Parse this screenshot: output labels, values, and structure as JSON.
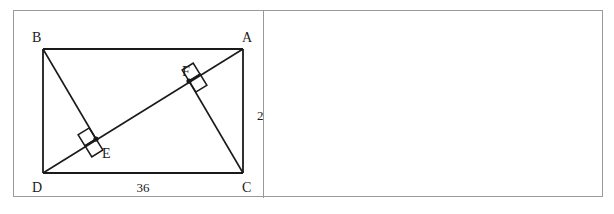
{
  "figure": {
    "shape": "rectangle",
    "vertices": [
      {
        "name": "B",
        "label": "B",
        "x": 29,
        "y": 38,
        "label_x": 18,
        "label_y": 31
      },
      {
        "name": "A",
        "label": "A",
        "x": 229,
        "y": 38,
        "label_x": 228,
        "label_y": 31
      },
      {
        "name": "C",
        "label": "C",
        "x": 229,
        "y": 162,
        "label_x": 228,
        "label_y": 181
      },
      {
        "name": "D",
        "label": "D",
        "x": 29,
        "y": 162,
        "label_x": 18,
        "label_y": 181
      }
    ],
    "points": [
      {
        "name": "E",
        "label": "E",
        "x": 82,
        "y": 128,
        "label_x": 88,
        "label_y": 147
      },
      {
        "name": "F",
        "label": "F",
        "x": 175,
        "y": 70,
        "label_x": 168,
        "label_y": 65
      }
    ],
    "segments": [
      {
        "name": "side-BA",
        "from": "B",
        "to": "A"
      },
      {
        "name": "side-AC",
        "from": "A",
        "to": "C"
      },
      {
        "name": "side-CD",
        "from": "C",
        "to": "D"
      },
      {
        "name": "side-DB",
        "from": "D",
        "to": "B"
      },
      {
        "name": "diagonal-DA",
        "from": "D",
        "to": "A"
      },
      {
        "name": "perpendicular-BE",
        "from": "B",
        "to": "E"
      },
      {
        "name": "perpendicular-CF",
        "from": "C",
        "to": "F"
      }
    ],
    "right_angles": [
      {
        "name": "right-angle-at-E",
        "at": "E"
      },
      {
        "name": "right-angle-at-F",
        "at": "F"
      }
    ],
    "measurements": [
      {
        "name": "side-length-AC",
        "value": "24",
        "x": 243,
        "y": 105,
        "anchor": "start"
      },
      {
        "name": "side-length-DC",
        "value": "36",
        "x": 129,
        "y": 181,
        "anchor": "middle"
      }
    ],
    "colors": {
      "stroke": "#1a1a1a",
      "frame": "#9a9a9a",
      "background": "#ffffff",
      "text": "#1a1a1a"
    }
  },
  "right_panel": {
    "content": ""
  }
}
